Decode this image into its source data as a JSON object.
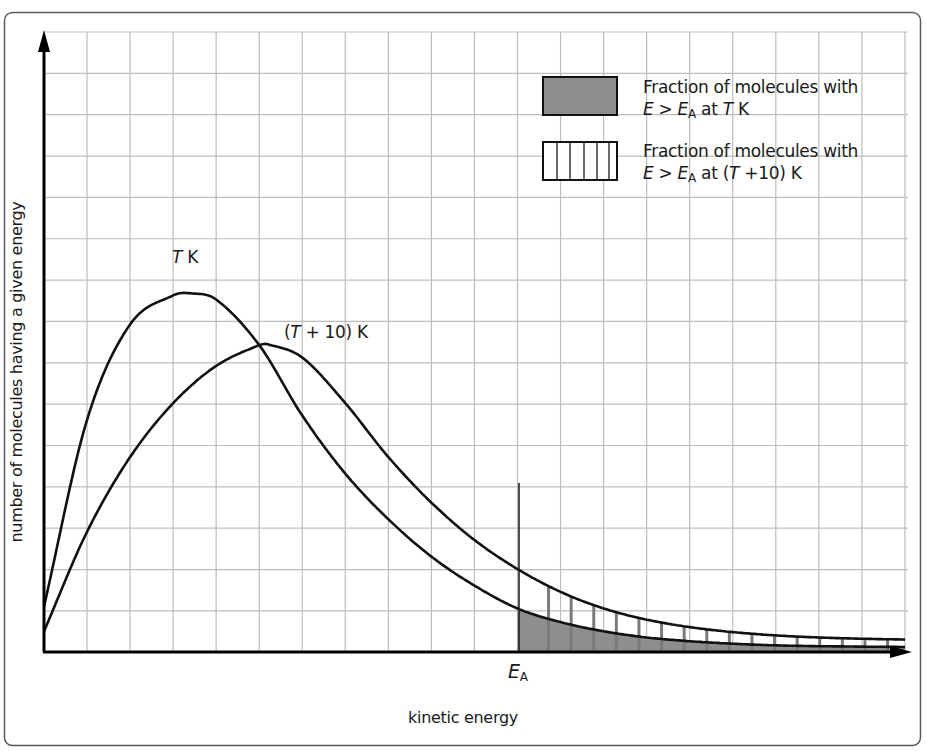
{
  "chart_data": {
    "type": "line",
    "title": "",
    "xlabel": "kinetic energy",
    "ylabel": "number of molecules having a given energy",
    "grid": true,
    "axis_ticks": "none (unlabeled axes)",
    "x_markers": [
      {
        "label": "E_A",
        "x": 11.0,
        "display": {
          "italic": "E",
          "sub": "A"
        }
      }
    ],
    "xlim": [
      0,
      20
    ],
    "ylim": [
      0,
      15
    ],
    "legend_position": "top-right",
    "legend": [
      {
        "swatch": "solid-gray",
        "line1": "Fraction of molecules with",
        "line2": {
          "pre_italic": "E",
          "gt": " > ",
          "sub_italic": "E",
          "sub": "A",
          "rest1": " at ",
          "rest_italic": "T",
          "rest2": " K"
        }
      },
      {
        "swatch": "vertical-hatch",
        "line1": "Fraction of molecules with",
        "line2": {
          "pre_italic": "E",
          "gt": " > ",
          "sub_italic": "E",
          "sub": "A",
          "rest1": " at (",
          "rest_italic": "T",
          "rest2": " +10) K"
        }
      }
    ],
    "series": [
      {
        "name": "T K",
        "label_text": {
          "italic": "T",
          "rest": " K"
        },
        "x": [
          0,
          1,
          2,
          3,
          3.4,
          4,
          5,
          6,
          7,
          8,
          9,
          10,
          11,
          12,
          13,
          14,
          15,
          16,
          17,
          18,
          19,
          20
        ],
        "y": [
          1.1,
          5.6,
          7.9,
          8.6,
          8.65,
          8.5,
          7.4,
          5.7,
          4.3,
          3.2,
          2.3,
          1.6,
          1.05,
          0.72,
          0.5,
          0.35,
          0.26,
          0.2,
          0.16,
          0.14,
          0.13,
          0.12
        ],
        "shaded_region": {
          "from_x": 11.0,
          "fill": "#8c8c8c"
        }
      },
      {
        "name": "(T + 10) K",
        "label_text": {
          "pre": "(",
          "italic": "T",
          "rest": " + 10) K"
        },
        "x": [
          0,
          1,
          2,
          3,
          4,
          5,
          5.2,
          6,
          7,
          8,
          9,
          10,
          11,
          12,
          13,
          14,
          15,
          16,
          17,
          18,
          19,
          20
        ],
        "y": [
          0.5,
          2.9,
          4.7,
          6.0,
          6.9,
          7.4,
          7.42,
          7.1,
          6.0,
          4.7,
          3.6,
          2.7,
          2.0,
          1.45,
          1.05,
          0.78,
          0.6,
          0.48,
          0.4,
          0.35,
          0.32,
          0.3
        ],
        "shaded_region": {
          "from_x": 11.0,
          "fill": "vertical-hatch"
        }
      }
    ],
    "colors": {
      "curve": "#111111",
      "grid": "#b8b8b8",
      "shade": "#8e8e8e",
      "axis": "#000000",
      "frame": "#555555"
    }
  }
}
